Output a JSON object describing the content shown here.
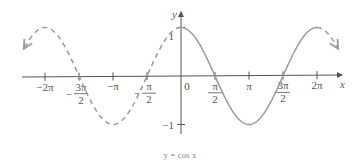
{
  "chart_data": {
    "type": "line",
    "title": "",
    "caption": "y = cos x",
    "function": "cos",
    "xlabel": "x",
    "ylabel": "y",
    "xlim": [
      -2.4,
      2.4
    ],
    "xlim_units": "pi",
    "ylim": [
      -1,
      1
    ],
    "grid": false,
    "legend": null,
    "series": [
      {
        "name": "cos x (extended, dashed)",
        "style": "dashed",
        "x_range_pi": [
          -2.3,
          0
        ],
        "color": "#9a9a9a"
      },
      {
        "name": "cos x (one period, solid)",
        "style": "solid",
        "x_range_pi": [
          0,
          2.0
        ],
        "color": "#9a9a9a"
      },
      {
        "name": "cos x (extended, dashed)",
        "style": "dashed",
        "x_range_pi": [
          2.0,
          2.3
        ],
        "color": "#9a9a9a"
      }
    ],
    "x_ticks": [
      {
        "value_pi": -2,
        "label": "−2π"
      },
      {
        "value_pi": -1.5,
        "label_num": "3π",
        "label_den": "2",
        "sign": "−"
      },
      {
        "value_pi": -1,
        "label": "−π"
      },
      {
        "value_pi": -0.5,
        "label_num": "π",
        "label_den": "2",
        "sign": "−"
      },
      {
        "value_pi": 0,
        "label": "0"
      },
      {
        "value_pi": 0.5,
        "label_num": "π",
        "label_den": "2",
        "sign": ""
      },
      {
        "value_pi": 1,
        "label": "π"
      },
      {
        "value_pi": 1.5,
        "label_num": "3π",
        "label_den": "2",
        "sign": ""
      },
      {
        "value_pi": 2,
        "label": "2π"
      }
    ],
    "y_ticks": [
      {
        "value": 1,
        "label": "1"
      },
      {
        "value": -1,
        "label": "−1"
      }
    ]
  },
  "colors": {
    "axis": "#555555",
    "curve": "#9a9a9a",
    "caption": "#8a8a8a"
  }
}
